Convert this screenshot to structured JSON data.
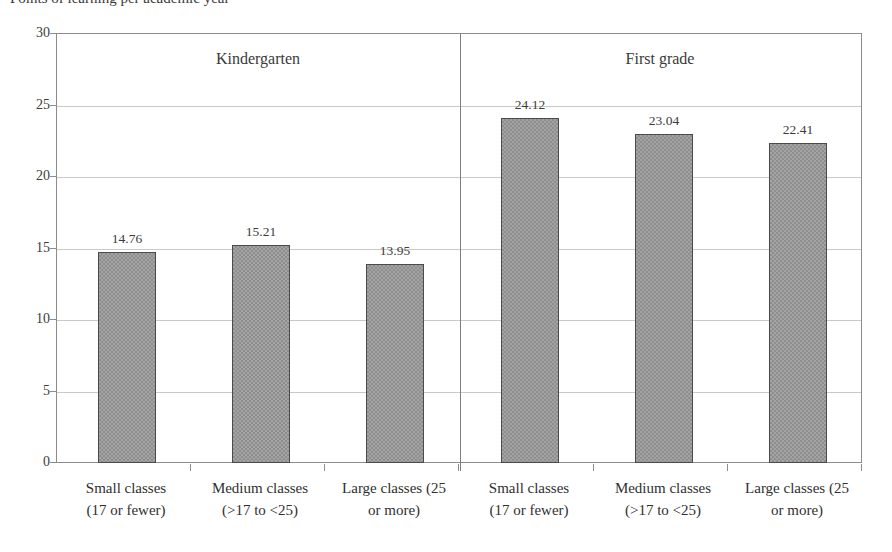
{
  "chart_data": {
    "type": "bar",
    "title": "Points of learning per academic year",
    "xlabel": "",
    "ylabel": "",
    "ylim": [
      0,
      30
    ],
    "ytick_step": 5,
    "yticks": [
      "0",
      "5",
      "10",
      "15",
      "20",
      "25",
      "30"
    ],
    "grid": "horizontal",
    "legend": "none",
    "panels": [
      {
        "name": "Kindergarten",
        "categories": [
          {
            "line1": "Small classes",
            "line2": "(17 or fewer)"
          },
          {
            "line1": "Medium classes",
            "line2": "(>17 to <25)"
          },
          {
            "line1": "Large classes (25",
            "line2": "or more)"
          }
        ],
        "values": [
          14.76,
          15.21,
          13.95
        ],
        "value_labels": [
          "14.76",
          "15.21",
          "13.95"
        ]
      },
      {
        "name": "First grade",
        "categories": [
          {
            "line1": "Small classes",
            "line2": "(17 or fewer)"
          },
          {
            "line1": "Medium classes",
            "line2": "(>17 to <25)"
          },
          {
            "line1": "Large classes (25",
            "line2": "or more)"
          }
        ],
        "values": [
          24.12,
          23.04,
          22.41
        ],
        "value_labels": [
          "24.12",
          "23.04",
          "22.41"
        ]
      }
    ],
    "colors": {
      "bar_fill": "#a3a3a3",
      "bar_border": "#4a4a4a",
      "gridline": "#c9c9c9",
      "axis": "#8c8c8c",
      "text": "#2f2f2f"
    }
  }
}
